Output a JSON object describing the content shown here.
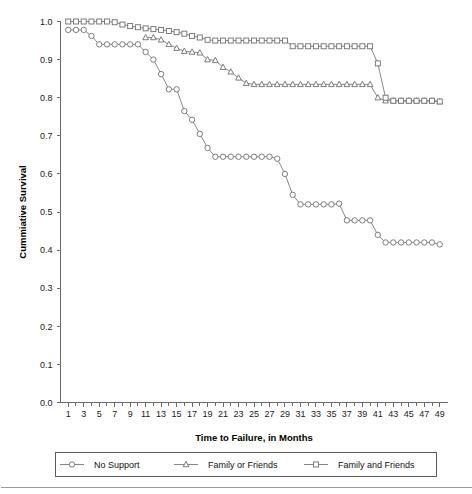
{
  "chart_data": {
    "type": "line",
    "title": "",
    "subtitle": "",
    "xlabel": "Time to Failure, in Months",
    "ylabel": "Cummiative Survival",
    "xlim": [
      0,
      50
    ],
    "ylim": [
      0.0,
      1.0
    ],
    "grid": false,
    "legend_position": "bottom",
    "x_ticks": [
      1,
      3,
      5,
      7,
      9,
      11,
      13,
      15,
      17,
      19,
      21,
      23,
      25,
      27,
      29,
      31,
      33,
      35,
      37,
      39,
      41,
      43,
      45,
      47,
      49
    ],
    "x_tick_labels": [
      "1",
      "3",
      "5",
      "7",
      "9",
      "11",
      "13",
      "15",
      "17",
      "19",
      "21",
      "23",
      "25",
      "27",
      "29",
      "31",
      "33",
      "35",
      "37",
      "39",
      "41",
      "43",
      "45",
      "47",
      "49"
    ],
    "x_minor_ticks": [
      2,
      4,
      6,
      8,
      10,
      12,
      14,
      16,
      18,
      20,
      22,
      24,
      26,
      28,
      30,
      32,
      34,
      36,
      38,
      40,
      42,
      44,
      46,
      48
    ],
    "y_ticks": [
      0.0,
      0.1,
      0.2,
      0.3,
      0.4,
      0.5,
      0.6,
      0.7,
      0.8,
      0.9,
      1.0
    ],
    "y_tick_labels": [
      "0.0",
      "0.1",
      "0.2",
      "0.3",
      "0.4",
      "0.5",
      "0.6",
      "0.7",
      "0.8",
      "0.9",
      "1.0"
    ],
    "series": [
      {
        "name": "No Support",
        "marker": "circle",
        "x": [
          1,
          2,
          3,
          4,
          5,
          6,
          7,
          8,
          9,
          10,
          11,
          12,
          13,
          14,
          15,
          16,
          17,
          18,
          19,
          20,
          21,
          22,
          23,
          24,
          25,
          26,
          27,
          28,
          29,
          30,
          31,
          32,
          33,
          34,
          35,
          36,
          37,
          38,
          39,
          40,
          41,
          42,
          43,
          44,
          45,
          46,
          47,
          48,
          49
        ],
        "values": [
          0.978,
          0.978,
          0.978,
          0.962,
          0.94,
          0.94,
          0.94,
          0.94,
          0.94,
          0.94,
          0.92,
          0.9,
          0.862,
          0.822,
          0.822,
          0.765,
          0.742,
          0.705,
          0.668,
          0.645,
          0.645,
          0.645,
          0.645,
          0.645,
          0.645,
          0.645,
          0.645,
          0.64,
          0.6,
          0.545,
          0.52,
          0.52,
          0.52,
          0.52,
          0.52,
          0.522,
          0.478,
          0.478,
          0.478,
          0.478,
          0.44,
          0.42,
          0.42,
          0.42,
          0.42,
          0.42,
          0.42,
          0.42,
          0.415
        ]
      },
      {
        "name": "Family or Friends",
        "marker": "triangle",
        "x": [
          11,
          12,
          13,
          14,
          15,
          16,
          17,
          18,
          19,
          20,
          21,
          22,
          23,
          24,
          25,
          26,
          27,
          28,
          29,
          30,
          31,
          32,
          33,
          34,
          35,
          36,
          37,
          38,
          39,
          40,
          41,
          42,
          43,
          44,
          45,
          46,
          47,
          48,
          49
        ],
        "values": [
          0.958,
          0.958,
          0.952,
          0.94,
          0.93,
          0.922,
          0.92,
          0.918,
          0.9,
          0.898,
          0.88,
          0.868,
          0.852,
          0.838,
          0.835,
          0.835,
          0.835,
          0.835,
          0.835,
          0.835,
          0.835,
          0.835,
          0.835,
          0.835,
          0.835,
          0.835,
          0.835,
          0.835,
          0.835,
          0.835,
          0.8,
          0.792,
          0.792,
          0.792,
          0.792,
          0.792,
          0.792,
          0.792,
          0.79
        ]
      },
      {
        "name": "Family and Friends",
        "marker": "square",
        "x": [
          1,
          2,
          3,
          4,
          5,
          6,
          7,
          8,
          9,
          10,
          11,
          12,
          13,
          14,
          15,
          16,
          17,
          18,
          19,
          20,
          21,
          22,
          23,
          24,
          25,
          26,
          27,
          28,
          29,
          30,
          31,
          32,
          33,
          34,
          35,
          36,
          37,
          38,
          39,
          40,
          41,
          42,
          43,
          44,
          45,
          46,
          47,
          48,
          49
        ],
        "values": [
          1.0,
          1.0,
          1.0,
          1.0,
          1.0,
          1.0,
          0.998,
          0.992,
          0.988,
          0.985,
          0.982,
          0.98,
          0.978,
          0.975,
          0.972,
          0.968,
          0.962,
          0.958,
          0.952,
          0.95,
          0.95,
          0.95,
          0.95,
          0.95,
          0.95,
          0.95,
          0.95,
          0.95,
          0.95,
          0.935,
          0.935,
          0.935,
          0.935,
          0.935,
          0.935,
          0.935,
          0.935,
          0.935,
          0.935,
          0.935,
          0.89,
          0.8,
          0.792,
          0.792,
          0.792,
          0.792,
          0.792,
          0.792,
          0.79
        ]
      }
    ]
  },
  "legend": {
    "entries": [
      {
        "label": "No Support",
        "marker": "circle"
      },
      {
        "label": "Family or Friends",
        "marker": "triangle"
      },
      {
        "label": "Family and Friends",
        "marker": "square"
      }
    ]
  }
}
